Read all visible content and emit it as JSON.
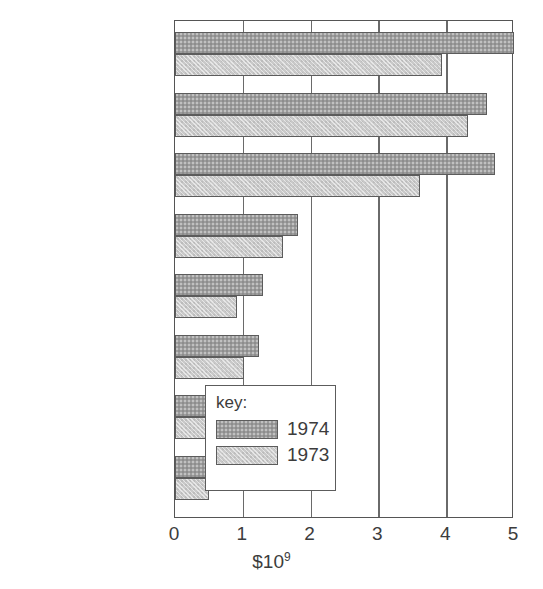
{
  "chart_data": {
    "type": "bar",
    "orientation": "horizontal",
    "title": "",
    "subtitle": "",
    "xlabel": "$10⁹",
    "ylabel": "",
    "xlim": [
      0,
      5
    ],
    "xticks": [
      0,
      1,
      2,
      3,
      4,
      5
    ],
    "xtick_labels": [
      "0",
      "1",
      "2",
      "3",
      "4",
      "5"
    ],
    "grid": true,
    "grid_axis": "x",
    "legend_position": "inside-lower-right",
    "legend_title": "key:",
    "categories": [
      "soybeans and\nproducts",
      "wheat and flour",
      "feed grains",
      "animals and\nproducts",
      "cotton,\nexcluding linters",
      "fruits, nuts, and\nvegetables",
      "tobacco",
      "rice"
    ],
    "series": [
      {
        "name": "1974",
        "color": "#9c9c9c",
        "values": [
          5.0,
          4.6,
          4.72,
          1.81,
          1.3,
          1.24,
          0.86,
          0.84
        ]
      },
      {
        "name": "1973",
        "color": "#c9c9c9",
        "values": [
          3.94,
          4.32,
          3.61,
          1.6,
          0.92,
          1.02,
          0.71,
          0.5
        ]
      }
    ]
  },
  "axis": {
    "unit_exponent": "9",
    "unit_base": "$10"
  }
}
